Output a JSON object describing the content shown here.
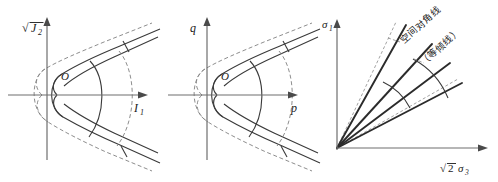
{
  "figure": {
    "background": "#ffffff",
    "stroke_solid": "#3a3a3a",
    "stroke_dashed": "#808080",
    "stroke_axis": "#6e6e6e",
    "panels": [
      {
        "id": "panel-meridian-j2-i1",
        "origin_label": "O",
        "y_axis": {
          "root": "√",
          "base": "J",
          "sub": "2"
        },
        "x_axis": {
          "base": "I",
          "sub": "1"
        },
        "curves": [
          "inner-solid-cone",
          "outer-dashed-cone",
          "solid-cap",
          "dashed-cap",
          "cross-arc"
        ]
      },
      {
        "id": "panel-meridian-q-p",
        "origin_label": "O",
        "y_axis": {
          "base": "q",
          "sub": ""
        },
        "x_axis": {
          "base": "p",
          "sub": ""
        },
        "curves": [
          "inner-solid-cone",
          "outer-dashed-cone",
          "solid-cap",
          "dashed-cap",
          "cross-arc"
        ]
      },
      {
        "id": "panel-principal-stress",
        "y_axis": {
          "base": "σ",
          "sub": "1"
        },
        "x_axis": {
          "root": "√",
          "coef": "2",
          "base": "σ",
          "sub": "3"
        },
        "annotations": [
          {
            "name": "space-diagonal",
            "text": "空间对角线"
          },
          {
            "name": "equal-inclination-line",
            "text": "（等倾线）"
          }
        ],
        "rays": 4,
        "dashed_rays": 2
      }
    ]
  }
}
